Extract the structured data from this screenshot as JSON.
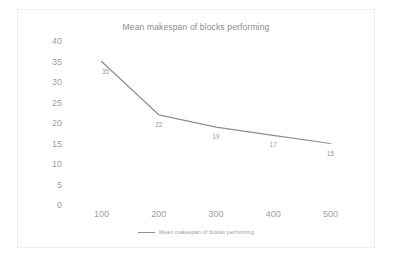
{
  "chart_data": {
    "type": "line",
    "title": "Mean makespan of blocks performing",
    "xlabel": "",
    "ylabel": "",
    "categories": [
      "100",
      "200",
      "300",
      "400",
      "500"
    ],
    "values": [
      35,
      22,
      19,
      17,
      15
    ],
    "point_labels": [
      "35",
      "22",
      "19",
      "17",
      "15"
    ],
    "series": [
      {
        "name": "Mean makespan of blocks performing",
        "values": [
          35,
          22,
          19,
          17,
          15
        ],
        "color": "#8e8e8e"
      }
    ],
    "ylim": [
      0,
      40
    ],
    "y_ticks": [
      "40",
      "35",
      "30",
      "25",
      "20",
      "15",
      "10",
      "5",
      "0"
    ],
    "y_tick_values": [
      40,
      35,
      30,
      25,
      20,
      15,
      10,
      5,
      0
    ],
    "x_ticks": [
      "100",
      "200",
      "300",
      "400",
      "500"
    ],
    "grid": false,
    "legend": {
      "position": "bottom",
      "entries": [
        "Mean makespan of blocks performing"
      ]
    },
    "colors": {
      "series_line": "#8e8e8e",
      "axis_text": "#a0a0a0",
      "title_text": "#8a8a8a",
      "label_text": "#9a9a9a",
      "frame_border": "#efefef",
      "background": "#ffffff"
    }
  }
}
